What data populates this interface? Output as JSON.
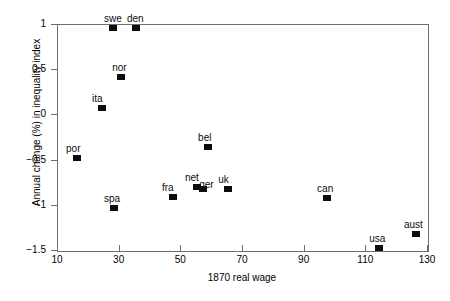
{
  "chart_data": {
    "type": "scatter",
    "title": "",
    "xlabel": "1870 real wage",
    "ylabel": "Annual change (%) in inequality index",
    "xlim": [
      10,
      130
    ],
    "ylim": [
      -1.5,
      1
    ],
    "xticks": [
      10,
      30,
      50,
      70,
      90,
      110,
      130
    ],
    "xtick_labels": [
      "10",
      "30",
      "50",
      "70",
      "90",
      "110",
      "130"
    ],
    "yticks": [
      1,
      0.5,
      0,
      -0.5,
      -1,
      -1.5
    ],
    "ytick_labels": [
      "1",
      "0.5",
      "0",
      "−0.5",
      "−1",
      "−1.5"
    ],
    "grid": false,
    "legend": null,
    "marker_color": "#0d0d0d",
    "axis_color": "#6e6e6e",
    "points": [
      {
        "label": "swe",
        "x": 28.2,
        "y": 0.96,
        "label_dx": -1,
        "label_dy": -14
      },
      {
        "label": "den",
        "x": 35.6,
        "y": 0.96,
        "label_dx": -1,
        "label_dy": -14
      },
      {
        "label": "nor",
        "x": 30.8,
        "y": 0.41,
        "label_dx": -1,
        "label_dy": -14
      },
      {
        "label": "ita",
        "x": 24.6,
        "y": 0.07,
        "label_dx": -2,
        "label_dy": -14
      },
      {
        "label": "por",
        "x": 16.5,
        "y": -0.48,
        "label_dx": -3,
        "label_dy": -14
      },
      {
        "label": "bel",
        "x": 59.0,
        "y": -0.36,
        "label_dx": -2,
        "label_dy": -14
      },
      {
        "label": "spa",
        "x": 28.5,
        "y": -1.04,
        "label_dx": -2,
        "label_dy": -14
      },
      {
        "label": "fra",
        "x": 47.6,
        "y": -0.91,
        "label_dx": -3,
        "label_dy": -14
      },
      {
        "label": "net",
        "x": 55.4,
        "y": -0.8,
        "label_dx": -4,
        "label_dy": -14
      },
      {
        "label": "ger",
        "x": 57.4,
        "y": -0.82,
        "label_dx": 4,
        "label_dy": -9
      },
      {
        "label": "uk",
        "x": 65.5,
        "y": -0.82,
        "label_dx": -2,
        "label_dy": -14
      },
      {
        "label": "can",
        "x": 97.6,
        "y": -0.92,
        "label_dx": -2,
        "label_dy": -14
      },
      {
        "label": "usa",
        "x": 114.5,
        "y": -1.48,
        "label_dx": -2,
        "label_dy": -14
      },
      {
        "label": "aust",
        "x": 126.4,
        "y": -1.32,
        "label_dx": -4,
        "label_dy": -14
      }
    ]
  }
}
